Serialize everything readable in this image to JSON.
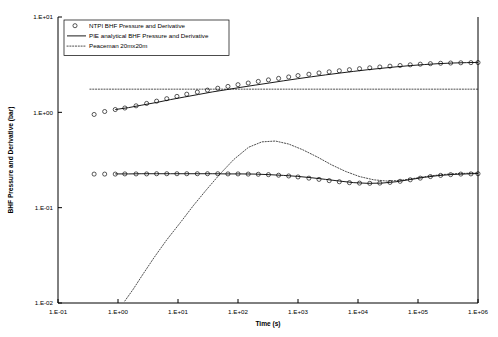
{
  "chart_data": {
    "type": "line",
    "title": "",
    "xlabel": "Time (s)",
    "ylabel": "BHF Pressure and Derivative (bar)",
    "xscale": "log",
    "yscale": "log",
    "xlim": [
      0.1,
      1000000
    ],
    "ylim": [
      0.01,
      10
    ],
    "grid": false,
    "legend_position": "top-left",
    "xticklabels": [
      "1.E-01",
      "1.E+00",
      "1.E+01",
      "1.E+02",
      "1.E+03",
      "1.E+04",
      "1.E+05",
      "1.E+06"
    ],
    "xtickvalues": [
      0.1,
      1,
      10,
      100,
      1000,
      10000,
      100000,
      1000000
    ],
    "yticklabels": [
      "1.E+01",
      "1.E+00",
      "1.E-01",
      "1.E-02"
    ],
    "ytickvalues": [
      10,
      1,
      0.1,
      0.01
    ],
    "legend": [
      {
        "label": "NTPI BHF Pressure and Derivative",
        "marker": "circle",
        "style": "markers"
      },
      {
        "label": "PIE analytical BHF Pressure and Derivative",
        "marker": "none",
        "style": "solid-line"
      },
      {
        "label": "Peaceman 20mx20m",
        "marker": "none",
        "style": "dotted-line"
      }
    ],
    "series": [
      {
        "name": "NTPI BHF Pressure and Derivative",
        "style": "markers",
        "branch": "pressure",
        "x": [
          0.4,
          0.6,
          0.9,
          1.3,
          2.0,
          3.0,
          4.4,
          6.5,
          9.6,
          14,
          21,
          31,
          46,
          68,
          100,
          148,
          218,
          322,
          475,
          700,
          1000,
          1520,
          2240,
          3310,
          4880,
          7200,
          10600,
          15700,
          23100,
          34100,
          50300,
          74200,
          109000,
          161000,
          238000,
          350000,
          517000,
          762000,
          1000000
        ],
        "y": [
          0.95,
          1.02,
          1.07,
          1.11,
          1.17,
          1.24,
          1.31,
          1.39,
          1.47,
          1.55,
          1.63,
          1.71,
          1.79,
          1.87,
          1.95,
          2.03,
          2.11,
          2.19,
          2.27,
          2.35,
          2.43,
          2.51,
          2.59,
          2.66,
          2.73,
          2.8,
          2.87,
          2.93,
          2.99,
          3.05,
          3.1,
          3.15,
          3.2,
          3.24,
          3.27,
          3.29,
          3.31,
          3.32,
          3.33
        ]
      },
      {
        "name": "NTPI BHF Pressure and Derivative",
        "style": "markers",
        "branch": "derivative",
        "x": [
          0.4,
          0.6,
          0.9,
          1.3,
          2.0,
          3.0,
          4.4,
          6.5,
          9.6,
          14,
          21,
          31,
          46,
          68,
          100,
          148,
          218,
          322,
          475,
          700,
          1000,
          1520,
          2240,
          3310,
          4880,
          7200,
          10600,
          15700,
          23100,
          34100,
          50300,
          74200,
          109000,
          161000,
          238000,
          350000,
          517000,
          762000,
          1000000
        ],
        "y": [
          0.225,
          0.225,
          0.225,
          0.226,
          0.226,
          0.226,
          0.227,
          0.227,
          0.227,
          0.227,
          0.227,
          0.227,
          0.227,
          0.226,
          0.226,
          0.225,
          0.224,
          0.222,
          0.219,
          0.215,
          0.21,
          0.204,
          0.198,
          0.192,
          0.187,
          0.183,
          0.181,
          0.18,
          0.181,
          0.184,
          0.189,
          0.196,
          0.204,
          0.212,
          0.218,
          0.222,
          0.225,
          0.226,
          0.227
        ]
      },
      {
        "name": "PIE analytical BHF Pressure and Derivative",
        "style": "solid-line",
        "branch": "pressure",
        "x": [
          0.9,
          1.5,
          2.5,
          4.4,
          7.5,
          13,
          22,
          38,
          65,
          112,
          193,
          330,
          570,
          980,
          1680,
          2880,
          4950,
          8500,
          14600,
          25000,
          43000,
          74000,
          127000,
          218000,
          375000,
          645000,
          1000000
        ],
        "y": [
          1.07,
          1.12,
          1.19,
          1.27,
          1.36,
          1.45,
          1.54,
          1.64,
          1.73,
          1.83,
          1.93,
          2.03,
          2.14,
          2.25,
          2.36,
          2.47,
          2.58,
          2.69,
          2.8,
          2.9,
          3.0,
          3.09,
          3.17,
          3.24,
          3.29,
          3.32,
          3.34
        ]
      },
      {
        "name": "PIE analytical BHF Pressure and Derivative",
        "style": "solid-line",
        "branch": "derivative",
        "x": [
          0.9,
          1.5,
          2.5,
          4.4,
          7.5,
          13,
          22,
          38,
          65,
          112,
          193,
          330,
          570,
          980,
          1680,
          2880,
          4950,
          8500,
          14600,
          25000,
          43000,
          74000,
          127000,
          218000,
          375000,
          645000,
          1000000
        ],
        "y": [
          0.226,
          0.226,
          0.227,
          0.227,
          0.227,
          0.227,
          0.227,
          0.227,
          0.226,
          0.226,
          0.225,
          0.222,
          0.218,
          0.213,
          0.206,
          0.198,
          0.19,
          0.183,
          0.18,
          0.181,
          0.187,
          0.197,
          0.208,
          0.217,
          0.223,
          0.226,
          0.228
        ]
      },
      {
        "name": "Peaceman 20mx20m",
        "style": "dotted-line",
        "branch": "pressure",
        "x": [
          0.34,
          1,
          10,
          100,
          1000,
          10000,
          100000,
          1000000
        ],
        "y": [
          1.75,
          1.75,
          1.75,
          1.75,
          1.75,
          1.75,
          1.75,
          1.75
        ]
      },
      {
        "name": "Peaceman 20mx20m",
        "style": "dotted-line",
        "branch": "derivative",
        "x": [
          1.3,
          1.8,
          2.6,
          4.0,
          6.5,
          11,
          18,
          30,
          50,
          85,
          150,
          250,
          420,
          700,
          1200,
          2100,
          3600,
          6200,
          10600,
          18200,
          31000,
          53000,
          91000,
          156000,
          268000,
          460000,
          790000,
          1000000
        ],
        "y": [
          0.0105,
          0.014,
          0.02,
          0.03,
          0.046,
          0.07,
          0.105,
          0.155,
          0.225,
          0.32,
          0.43,
          0.49,
          0.5,
          0.465,
          0.405,
          0.34,
          0.282,
          0.24,
          0.212,
          0.196,
          0.19,
          0.194,
          0.204,
          0.215,
          0.223,
          0.228,
          0.23,
          0.231
        ]
      }
    ]
  }
}
